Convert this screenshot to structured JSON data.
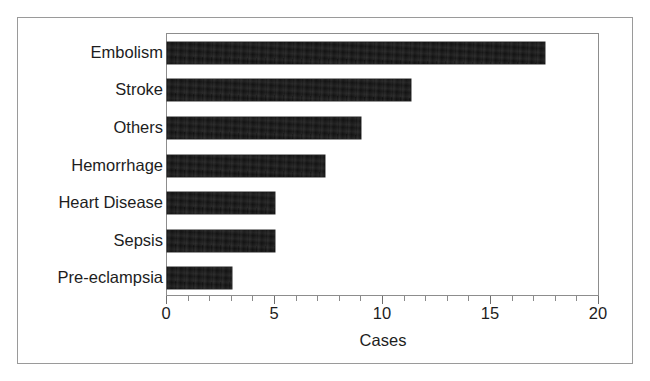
{
  "chart_data": {
    "type": "bar",
    "orientation": "horizontal",
    "title": "",
    "xlabel": "Cases",
    "ylabel": "",
    "categories": [
      "Embolism",
      "Stroke",
      "Others",
      "Hemorrhage",
      "Heart Disease",
      "Sepsis",
      "Pre-eclampsia"
    ],
    "values": [
      17.5,
      11.3,
      9.0,
      7.3,
      5.0,
      5.0,
      3.0
    ],
    "xlim": [
      0,
      20
    ],
    "xticks": [
      0,
      5,
      10,
      15,
      20
    ],
    "xticklabels": [
      "0",
      "5",
      "10",
      "15",
      "20"
    ],
    "minor_tick_interval": 1,
    "grid": false,
    "legend": null,
    "bar_color": "#121212",
    "frame_color": "#8d8d8d",
    "background_color": "#ffffff"
  },
  "figure": {
    "outer_border_color": "#9a9a9a"
  }
}
